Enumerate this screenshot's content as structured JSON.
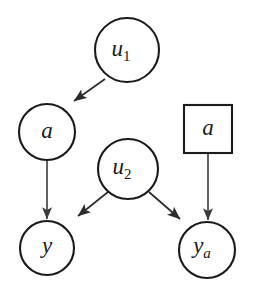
{
  "figure": {
    "type": "causal-dag",
    "background_color": "#ffffff",
    "stroke_color": "#1a1a1a",
    "edge_color": "#3a3a3a"
  },
  "nodes": [
    {
      "id": "u1",
      "label_base": "u",
      "label_sub": "1",
      "shape": "circle",
      "cx": 127,
      "cy": 50,
      "r": 32
    },
    {
      "id": "a_circle",
      "label_base": "a",
      "label_sub": "",
      "shape": "circle",
      "cx": 47,
      "cy": 132,
      "r": 28
    },
    {
      "id": "a_square",
      "label_base": "a",
      "label_sub": "",
      "shape": "square",
      "cx": 208,
      "cy": 129,
      "half": 24
    },
    {
      "id": "u2",
      "label_base": "u",
      "label_sub": "2",
      "shape": "circle",
      "cx": 128,
      "cy": 169,
      "r": 30
    },
    {
      "id": "y",
      "label_base": "y",
      "label_sub": "",
      "shape": "circle",
      "cx": 47,
      "cy": 248,
      "r": 27
    },
    {
      "id": "ya",
      "label_base": "y",
      "label_sub": "a",
      "shape": "circle",
      "cx": 207,
      "cy": 250,
      "r": 28
    }
  ],
  "edges": [
    {
      "id": "u1-to-a",
      "from": "u1",
      "to": "a_circle",
      "style": "diagonal"
    },
    {
      "id": "a-to-y",
      "from": "a_circle",
      "to": "y",
      "style": "vertical"
    },
    {
      "id": "u2-to-y",
      "from": "u2",
      "to": "y",
      "style": "diagonal"
    },
    {
      "id": "u2-to-ya",
      "from": "u2",
      "to": "ya",
      "style": "diagonal"
    },
    {
      "id": "asquare-to-ya",
      "from": "a_square",
      "to": "ya",
      "style": "vertical"
    }
  ]
}
